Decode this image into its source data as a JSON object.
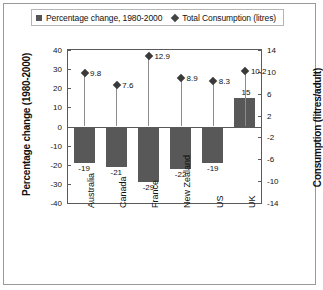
{
  "legend": {
    "series1_label": "Percentage change, 1980-2000",
    "series1_marker": "square-marker",
    "series2_label": "Total Consumption (litres)",
    "series2_marker": "diamond-marker"
  },
  "axes": {
    "left_title": "Percentage change (1980-2000)",
    "right_title": "Consumption (litres/adult)",
    "left_ticks": [
      "40",
      "30",
      "20",
      "10",
      "0",
      "-10",
      "-20",
      "-30",
      "-40"
    ],
    "right_ticks": [
      "14",
      "10",
      "6",
      "2",
      "-2",
      "-6",
      "-10",
      "-14"
    ]
  },
  "chart_data": {
    "type": "bar",
    "title": "",
    "subtitle": "",
    "xlabel": "",
    "ylabel": "Percentage change (1980-2000)",
    "y2label": "Consumption (litres/adult)",
    "ylim": [
      -40,
      40
    ],
    "y2lim": [
      -14,
      14
    ],
    "grid": false,
    "legend_position": "top",
    "categories": [
      "Australia",
      "Canada",
      "France",
      "New Zealand",
      "US",
      "UK"
    ],
    "series": [
      {
        "name": "Percentage change, 1980-2000",
        "type": "bar",
        "axis": "left",
        "values": [
          -19,
          -21,
          -29,
          -22,
          -19,
          15
        ],
        "labels": [
          "-19",
          "-21",
          "-29",
          "-22",
          "-19",
          "15"
        ],
        "color": "#585858"
      },
      {
        "name": "Total Consumption (litres)",
        "type": "scatter",
        "axis": "right",
        "values": [
          9.8,
          7.6,
          12.9,
          8.9,
          8.3,
          10.2
        ],
        "labels": [
          "9.8",
          "7.6",
          "12.9",
          "8.9",
          "8.3",
          "10.2"
        ],
        "color": "#3a3a3a"
      }
    ]
  },
  "xlabels": {
    "australia": "Australia",
    "canada": "Canada",
    "france": "France",
    "new_zealand": "New\nZealand",
    "us": "US",
    "uk": "UK"
  }
}
